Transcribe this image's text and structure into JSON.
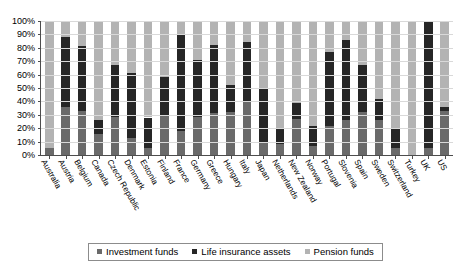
{
  "chart_data": {
    "type": "bar",
    "subtype": "stacked-percentage",
    "title": "",
    "xlabel": "",
    "ylabel": "",
    "ylim": [
      0,
      100
    ],
    "ytick_labels": [
      "0%",
      "10%",
      "20%",
      "30%",
      "40%",
      "50%",
      "60%",
      "70%",
      "80%",
      "90%",
      "100%"
    ],
    "ytick_values": [
      0,
      10,
      20,
      30,
      40,
      50,
      60,
      70,
      80,
      90,
      100
    ],
    "grid": true,
    "legend_position": "bottom",
    "categories": [
      "Australia",
      "Austria",
      "Belgium",
      "Canada",
      "Czech Republic",
      "Denmark",
      "Estonia",
      "Finland",
      "France",
      "Germany",
      "Greece",
      "Hungary",
      "Italy",
      "Japan",
      "Netherlands",
      "New Zealand",
      "Norway",
      "Portugal",
      "Slovenia",
      "Spain",
      "Sweden",
      "Switzerland",
      "Turkey",
      "UK",
      "US"
    ],
    "series": [
      {
        "name": "Investment funds",
        "color": "#6a6a6a",
        "values": [
          5,
          36,
          33,
          16,
          28,
          13,
          5,
          29,
          18,
          28,
          31,
          32,
          40,
          10,
          8,
          27,
          7,
          22,
          26,
          32,
          26,
          5,
          0,
          5,
          33
        ]
      },
      {
        "name": "Life insurance assets",
        "color": "#262626",
        "values": [
          0,
          52,
          48,
          10,
          39,
          48,
          23,
          29,
          72,
          43,
          51,
          20,
          44,
          39,
          12,
          12,
          15,
          55,
          60,
          35,
          16,
          15,
          0,
          95,
          3
        ]
      },
      {
        "name": "Pension funds",
        "color": "#b3b3b3",
        "values": [
          95,
          12,
          19,
          74,
          33,
          39,
          72,
          42,
          10,
          29,
          18,
          48,
          16,
          51,
          80,
          61,
          78,
          23,
          14,
          33,
          58,
          80,
          100,
          0,
          64
        ]
      }
    ]
  },
  "legend": {
    "items": [
      {
        "label": "Investment funds",
        "color": "#6a6a6a"
      },
      {
        "label": "Life insurance assets",
        "color": "#262626"
      },
      {
        "label": "Pension funds",
        "color": "#b3b3b3"
      }
    ]
  }
}
